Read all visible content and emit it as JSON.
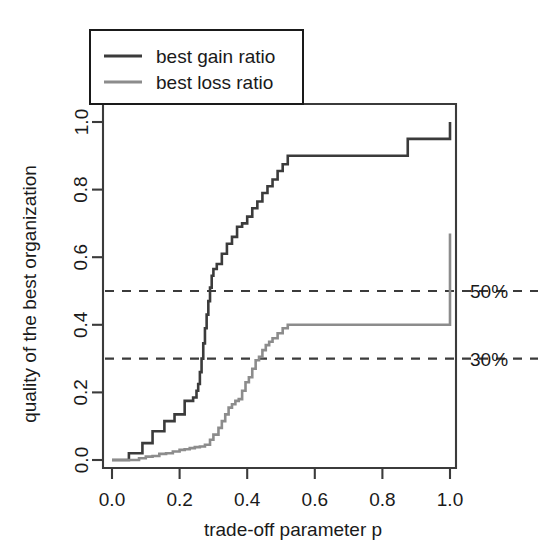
{
  "chart_data": {
    "type": "line",
    "title": "",
    "xlabel": "trade-off parameter p",
    "ylabel": "quality of the best organization",
    "xlim": [
      -0.02,
      1.02
    ],
    "ylim": [
      -0.04,
      1.06
    ],
    "xticks": [
      "0.0",
      "0.2",
      "0.4",
      "0.6",
      "0.8",
      "1.0"
    ],
    "xtick_values": [
      0.0,
      0.2,
      0.4,
      0.6,
      0.8,
      1.0
    ],
    "yticks": [
      "0.0",
      "0.2",
      "0.4",
      "0.6",
      "0.8",
      "1.0"
    ],
    "ytick_values": [
      0.0,
      0.2,
      0.4,
      0.6,
      0.8,
      1.0
    ],
    "grid": false,
    "legend_position": "top-left",
    "legend_entries": [
      "best gain ratio",
      "best loss ratio"
    ],
    "colors": {
      "best_gain_ratio": "#3b3b3b",
      "best_loss_ratio": "#8c8c8c",
      "reference_line": "#3b3b3b",
      "axis": "#3b3b3b",
      "background": "#ffffff"
    },
    "reference_lines": [
      {
        "label": "50%",
        "y": 0.5,
        "style": "dashed"
      },
      {
        "label": "30%",
        "y": 0.3,
        "style": "dashed"
      }
    ],
    "series": [
      {
        "name": "best gain ratio",
        "drawstyle": "steps-post",
        "color": "#3b3b3b",
        "linewidth": 2.6,
        "x": [
          0.0,
          0.04,
          0.05,
          0.07,
          0.09,
          0.11,
          0.12,
          0.14,
          0.155,
          0.17,
          0.185,
          0.2,
          0.215,
          0.225,
          0.24,
          0.25,
          0.255,
          0.26,
          0.265,
          0.27,
          0.275,
          0.28,
          0.285,
          0.29,
          0.295,
          0.3,
          0.31,
          0.325,
          0.34,
          0.355,
          0.37,
          0.385,
          0.4,
          0.415,
          0.43,
          0.445,
          0.46,
          0.475,
          0.49,
          0.505,
          0.52,
          0.86,
          0.875,
          1.0
        ],
        "y": [
          0.0,
          0.0,
          0.02,
          0.02,
          0.05,
          0.05,
          0.085,
          0.085,
          0.115,
          0.115,
          0.135,
          0.135,
          0.175,
          0.175,
          0.185,
          0.205,
          0.225,
          0.26,
          0.3,
          0.345,
          0.39,
          0.43,
          0.47,
          0.51,
          0.545,
          0.565,
          0.58,
          0.61,
          0.64,
          0.66,
          0.69,
          0.7,
          0.72,
          0.745,
          0.765,
          0.79,
          0.81,
          0.83,
          0.855,
          0.875,
          0.9,
          0.9,
          0.95,
          1.0
        ]
      },
      {
        "name": "best loss ratio",
        "drawstyle": "steps-post",
        "color": "#8c8c8c",
        "linewidth": 2.6,
        "x": [
          0.0,
          0.06,
          0.08,
          0.1,
          0.12,
          0.14,
          0.16,
          0.18,
          0.2,
          0.215,
          0.23,
          0.245,
          0.26,
          0.275,
          0.29,
          0.3,
          0.315,
          0.325,
          0.335,
          0.345,
          0.355,
          0.365,
          0.375,
          0.385,
          0.395,
          0.405,
          0.415,
          0.425,
          0.435,
          0.445,
          0.455,
          0.465,
          0.475,
          0.49,
          0.505,
          0.52,
          0.86,
          1.0
        ],
        "y": [
          0.0,
          0.0,
          0.005,
          0.01,
          0.012,
          0.018,
          0.02,
          0.025,
          0.03,
          0.032,
          0.035,
          0.038,
          0.04,
          0.045,
          0.06,
          0.075,
          0.095,
          0.115,
          0.135,
          0.155,
          0.165,
          0.175,
          0.18,
          0.205,
          0.23,
          0.245,
          0.27,
          0.295,
          0.305,
          0.325,
          0.34,
          0.35,
          0.36,
          0.375,
          0.39,
          0.4,
          0.4,
          0.67
        ]
      }
    ]
  },
  "legend": {
    "items": [
      {
        "label": "best gain ratio",
        "color": "#3b3b3b"
      },
      {
        "label": "best loss ratio",
        "color": "#8c8c8c"
      }
    ]
  },
  "annotations": {
    "fifty_percent": "50%",
    "thirty_percent": "30%"
  },
  "axes": {
    "x_title": "trade-off parameter p",
    "y_title": "quality of the best organization"
  }
}
